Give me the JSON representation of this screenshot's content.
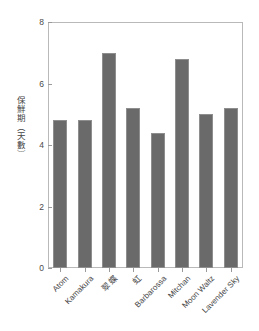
{
  "chart_data": {
    "type": "bar",
    "title": "",
    "xlabel": "",
    "ylabel": "保鮮期（天數）",
    "ylim": [
      0,
      8
    ],
    "yticks": [
      0,
      2,
      4,
      6,
      8
    ],
    "ytick_labels": [
      "0",
      "2",
      "4",
      "6",
      "8"
    ],
    "grid": false,
    "legend": null,
    "bar_color": "#6a6a6a",
    "bar_edge_color": "#8e8e8e",
    "axis_color": "#b9b9b9",
    "categories": [
      "Atom",
      "Kamakura",
      "翠蝶",
      "虹",
      "Barbarossa",
      "Mitchan",
      "Moon Waltz",
      "Lavender Sky"
    ],
    "values": [
      4.8,
      4.8,
      7.0,
      5.2,
      4.4,
      6.8,
      5.0,
      5.2
    ]
  }
}
